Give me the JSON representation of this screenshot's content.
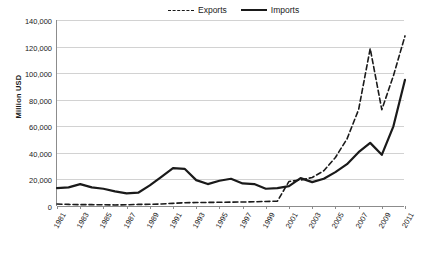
{
  "chart_data": {
    "type": "line",
    "title": "",
    "xlabel": "",
    "ylabel": "Million USD",
    "ylim": [
      0,
      140000
    ],
    "yticks": [
      0,
      20000,
      40000,
      60000,
      80000,
      100000,
      120000,
      140000
    ],
    "ytick_labels": [
      "0",
      "20,000",
      "40,000",
      "60,000",
      "80,000",
      "100,000",
      "120,000",
      "140,000"
    ],
    "grid": true,
    "legend_position": "top-center",
    "x": [
      1981,
      1982,
      1983,
      1984,
      1985,
      1986,
      1987,
      1988,
      1989,
      1990,
      1991,
      1992,
      1993,
      1994,
      1995,
      1996,
      1997,
      1998,
      1999,
      2000,
      2001,
      2002,
      2003,
      2004,
      2005,
      2006,
      2007,
      2008,
      2009,
      2010,
      2011
    ],
    "xtick_labels": [
      "1981",
      "1983",
      "1985",
      "1987",
      "1989",
      "1991",
      "1993",
      "1995",
      "1997",
      "1999",
      "2001",
      "2003",
      "2005",
      "2007",
      "2009",
      "2011"
    ],
    "series": [
      {
        "name": "Exports",
        "style": "dashed",
        "color": "#1a1a1a",
        "values": [
          1000,
          900,
          800,
          800,
          700,
          700,
          900,
          1500,
          2500,
          3500,
          4000,
          4500,
          4800,
          5000,
          5200,
          5300,
          5300,
          5400,
          5500,
          5600,
          5800,
          6000,
          6200,
          6500,
          6800,
          7000,
          7200,
          7400,
          7500,
          7600,
          7800
        ]
      },
      {
        "name": "Imports",
        "style": "solid",
        "color": "#1a1a1a",
        "values": [
          13500,
          14000,
          16500,
          14000,
          13000,
          11000,
          9500,
          10000,
          15500,
          22000,
          28500,
          28000,
          19500,
          16500,
          19000,
          20500,
          17000,
          16500,
          13000,
          13500,
          15000,
          21000,
          18000,
          20500,
          25500,
          31500,
          40500,
          47500,
          38500,
          60000,
          95000
        ]
      },
      {
        "name": "Exports-actual",
        "style": "dashed",
        "color": "#1a1a1a",
        "values": [
          1500,
          1200,
          1000,
          1000,
          900,
          800,
          900,
          1200,
          1300,
          1500,
          2000,
          2500,
          2600,
          2700,
          2800,
          2900,
          3000,
          3200,
          3400,
          3600,
          18500,
          19500,
          21500,
          26500,
          36500,
          50500,
          72500,
          118500,
          72500,
          98000,
          128000
        ]
      }
    ],
    "legend": [
      "Exports",
      "Imports"
    ]
  }
}
